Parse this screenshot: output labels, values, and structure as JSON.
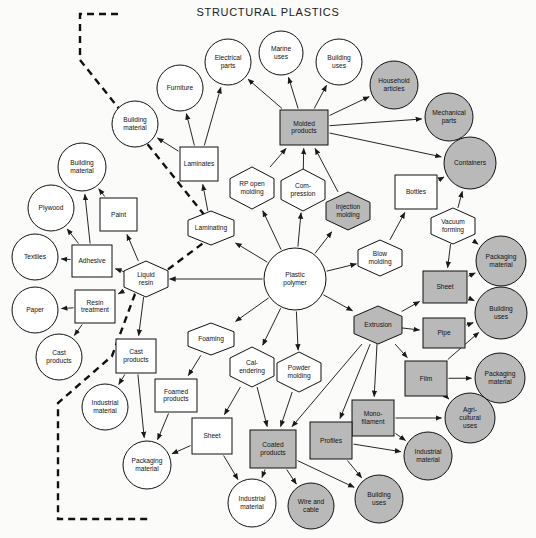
{
  "diagram": {
    "title": "STRUCTURAL PLASTICS",
    "legend": {
      "shaded_meaning": "shaded",
      "plain_meaning": "plain"
    },
    "colors": {
      "shaded": "#b9b9b9",
      "plain": "#ffffff",
      "stroke": "#111111",
      "background": "#fbfbf9"
    },
    "nodes": [
      {
        "id": "n1",
        "label": "Building material",
        "shape": "circle",
        "fill": "plain",
        "cx": 135,
        "cy": 124,
        "r": 23
      },
      {
        "id": "n2",
        "label": "Furniture",
        "shape": "circle",
        "fill": "plain",
        "cx": 180,
        "cy": 88,
        "r": 23
      },
      {
        "id": "n3",
        "label": "Electrical parts",
        "shape": "circle",
        "fill": "plain",
        "cx": 228,
        "cy": 62,
        "r": 23
      },
      {
        "id": "n4",
        "label": "Marine uses",
        "shape": "circle",
        "fill": "plain",
        "cx": 281,
        "cy": 53,
        "r": 22
      },
      {
        "id": "n5",
        "label": "Building uses",
        "shape": "circle",
        "fill": "plain",
        "cx": 339,
        "cy": 62,
        "r": 23
      },
      {
        "id": "n6",
        "label": "Household articles",
        "shape": "circle",
        "fill": "shaded",
        "cx": 394,
        "cy": 85,
        "r": 24
      },
      {
        "id": "n7",
        "label": "Mechanical parts",
        "shape": "circle",
        "fill": "shaded",
        "cx": 449,
        "cy": 117,
        "r": 24
      },
      {
        "id": "n8",
        "label": "Containers",
        "shape": "circle",
        "fill": "shaded",
        "cx": 470,
        "cy": 163,
        "r": 26
      },
      {
        "id": "n9",
        "label": "Building material",
        "shape": "circle",
        "fill": "plain",
        "cx": 82,
        "cy": 167,
        "r": 24
      },
      {
        "id": "n10",
        "label": "Plywood",
        "shape": "circle",
        "fill": "plain",
        "cx": 51,
        "cy": 208,
        "r": 23
      },
      {
        "id": "n11",
        "label": "Textiles",
        "shape": "circle",
        "fill": "plain",
        "cx": 35,
        "cy": 257,
        "r": 23
      },
      {
        "id": "n12",
        "label": "Paper",
        "shape": "circle",
        "fill": "plain",
        "cx": 35,
        "cy": 310,
        "r": 23
      },
      {
        "id": "n13",
        "label": "Cast products",
        "shape": "circle",
        "fill": "plain",
        "cx": 59,
        "cy": 357,
        "r": 23
      },
      {
        "id": "n14",
        "label": "Industrial material",
        "shape": "circle",
        "fill": "plain",
        "cx": 105,
        "cy": 407,
        "r": 23
      },
      {
        "id": "n15",
        "label": "Packaging material",
        "shape": "circle",
        "fill": "plain",
        "cx": 147,
        "cy": 465,
        "r": 24
      },
      {
        "id": "n16",
        "label": "Industrial material",
        "shape": "circle",
        "fill": "plain",
        "cx": 252,
        "cy": 503,
        "r": 24
      },
      {
        "id": "n17",
        "label": "Wire and cable",
        "shape": "circle",
        "fill": "shaded",
        "cx": 311,
        "cy": 506,
        "r": 23
      },
      {
        "id": "n18",
        "label": "Building uses",
        "shape": "circle",
        "fill": "shaded",
        "cx": 379,
        "cy": 499,
        "r": 24
      },
      {
        "id": "n19",
        "label": "Industrial material",
        "shape": "circle",
        "fill": "shaded",
        "cx": 428,
        "cy": 456,
        "r": 24
      },
      {
        "id": "n20",
        "label": "Agri- cultural uses",
        "shape": "circle",
        "fill": "shaded",
        "cx": 470,
        "cy": 418,
        "r": 25
      },
      {
        "id": "n21",
        "label": "Packaging material",
        "shape": "circle",
        "fill": "shaded",
        "cx": 500,
        "cy": 378,
        "r": 25
      },
      {
        "id": "n22",
        "label": "Building uses",
        "shape": "circle",
        "fill": "shaded",
        "cx": 501,
        "cy": 313,
        "r": 26
      },
      {
        "id": "n23",
        "label": "Packaging material",
        "shape": "circle",
        "fill": "shaded",
        "cx": 501,
        "cy": 261,
        "r": 25
      },
      {
        "id": "n24",
        "label": "Plastic polymer",
        "shape": "circle",
        "fill": "plain",
        "cx": 295,
        "cy": 279,
        "r": 31
      },
      {
        "id": "n25",
        "label": "Laminates",
        "shape": "rect",
        "fill": "plain",
        "x": 180,
        "y": 147,
        "w": 38,
        "h": 34
      },
      {
        "id": "n26",
        "label": "Molded products",
        "shape": "rect",
        "fill": "shaded",
        "x": 280,
        "y": 110,
        "w": 48,
        "h": 35
      },
      {
        "id": "n27",
        "label": "Paint",
        "shape": "rect",
        "fill": "plain",
        "x": 100,
        "y": 198,
        "w": 37,
        "h": 33
      },
      {
        "id": "n28",
        "label": "Adhesive",
        "shape": "rect",
        "fill": "plain",
        "x": 72,
        "y": 245,
        "w": 40,
        "h": 32
      },
      {
        "id": "n29",
        "label": "Resin treatment",
        "shape": "rect",
        "fill": "plain",
        "x": 75,
        "y": 290,
        "w": 40,
        "h": 33
      },
      {
        "id": "n30",
        "label": "Bottles",
        "shape": "rect",
        "fill": "plain",
        "x": 395,
        "y": 175,
        "w": 42,
        "h": 34
      },
      {
        "id": "n31",
        "label": "Sheet",
        "shape": "rect",
        "fill": "shaded",
        "x": 423,
        "y": 271,
        "w": 44,
        "h": 32
      },
      {
        "id": "n32",
        "label": "Pipe",
        "shape": "rect",
        "fill": "shaded",
        "x": 423,
        "y": 318,
        "w": 42,
        "h": 30
      },
      {
        "id": "n33",
        "label": "Film",
        "shape": "rect",
        "fill": "shaded",
        "x": 405,
        "y": 361,
        "w": 42,
        "h": 35
      },
      {
        "id": "n34",
        "label": "Mono- filament",
        "shape": "rect",
        "fill": "shaded",
        "x": 352,
        "y": 400,
        "w": 42,
        "h": 36
      },
      {
        "id": "n35",
        "label": "Profiles",
        "shape": "rect",
        "fill": "shaded",
        "x": 310,
        "y": 422,
        "w": 42,
        "h": 37
      },
      {
        "id": "n36",
        "label": "Coated products",
        "shape": "rect",
        "fill": "shaded",
        "x": 250,
        "y": 430,
        "w": 46,
        "h": 38
      },
      {
        "id": "n37",
        "label": "Sheet",
        "shape": "rect",
        "fill": "plain",
        "x": 192,
        "y": 418,
        "w": 40,
        "h": 36
      },
      {
        "id": "n38",
        "label": "Foamed products",
        "shape": "rect",
        "fill": "plain",
        "x": 155,
        "y": 379,
        "w": 42,
        "h": 33
      },
      {
        "id": "n39",
        "label": "Cast products",
        "shape": "rect",
        "fill": "plain",
        "x": 116,
        "y": 339,
        "w": 40,
        "h": 34
      },
      {
        "id": "n40",
        "label": "Laminating",
        "shape": "hex",
        "fill": "plain",
        "cx": 211,
        "cy": 228,
        "w": 46,
        "h": 34
      },
      {
        "id": "n41",
        "label": "RP open molding",
        "shape": "hex",
        "fill": "plain",
        "cx": 252,
        "cy": 188,
        "w": 44,
        "h": 42
      },
      {
        "id": "n42",
        "label": "Com- pression",
        "shape": "hex",
        "fill": "plain",
        "cx": 303,
        "cy": 190,
        "w": 44,
        "h": 42
      },
      {
        "id": "n43",
        "label": "Injection molding",
        "shape": "hex",
        "fill": "shaded",
        "cx": 348,
        "cy": 211,
        "w": 44,
        "h": 38
      },
      {
        "id": "n44",
        "label": "Blow molding",
        "shape": "hex",
        "fill": "plain",
        "cx": 380,
        "cy": 258,
        "w": 44,
        "h": 36
      },
      {
        "id": "n45",
        "label": "Vacuum forming",
        "shape": "hex",
        "fill": "plain",
        "cx": 453,
        "cy": 226,
        "w": 44,
        "h": 36
      },
      {
        "id": "n46",
        "label": "Extrusion",
        "shape": "hex",
        "fill": "shaded",
        "cx": 378,
        "cy": 325,
        "w": 48,
        "h": 38
      },
      {
        "id": "n47",
        "label": "Liquid resin",
        "shape": "hex",
        "fill": "plain",
        "cx": 146,
        "cy": 279,
        "w": 44,
        "h": 36
      },
      {
        "id": "n48",
        "label": "Foaming",
        "shape": "hex",
        "fill": "plain",
        "cx": 211,
        "cy": 339,
        "w": 46,
        "h": 32
      },
      {
        "id": "n49",
        "label": "Cal- endering",
        "shape": "hex",
        "fill": "plain",
        "cx": 252,
        "cy": 367,
        "w": 44,
        "h": 40
      },
      {
        "id": "n50",
        "label": "Powder molding",
        "shape": "hex",
        "fill": "plain",
        "cx": 299,
        "cy": 372,
        "w": 44,
        "h": 40
      }
    ],
    "edges": [
      {
        "from": "n25",
        "to": "n1"
      },
      {
        "from": "n25",
        "to": "n2"
      },
      {
        "from": "n25",
        "to": "n3"
      },
      {
        "from": "n26",
        "to": "n3"
      },
      {
        "from": "n26",
        "to": "n4"
      },
      {
        "from": "n26",
        "to": "n5"
      },
      {
        "from": "n26",
        "to": "n6"
      },
      {
        "from": "n26",
        "to": "n7"
      },
      {
        "from": "n26",
        "to": "n8"
      },
      {
        "from": "n40",
        "to": "n25"
      },
      {
        "from": "n41",
        "to": "n26"
      },
      {
        "from": "n42",
        "to": "n26"
      },
      {
        "from": "n43",
        "to": "n26"
      },
      {
        "from": "n24",
        "to": "n40"
      },
      {
        "from": "n24",
        "to": "n41"
      },
      {
        "from": "n24",
        "to": "n42"
      },
      {
        "from": "n24",
        "to": "n43"
      },
      {
        "from": "n24",
        "to": "n44"
      },
      {
        "from": "n24",
        "to": "n46"
      },
      {
        "from": "n24",
        "to": "n47"
      },
      {
        "from": "n24",
        "to": "n48"
      },
      {
        "from": "n24",
        "to": "n49"
      },
      {
        "from": "n24",
        "to": "n50"
      },
      {
        "from": "n44",
        "to": "n30"
      },
      {
        "from": "n30",
        "to": "n8"
      },
      {
        "from": "n45",
        "to": "n8"
      },
      {
        "from": "n45",
        "to": "n31"
      },
      {
        "from": "n45",
        "to": "n23"
      },
      {
        "from": "n31",
        "to": "n23"
      },
      {
        "from": "n31",
        "to": "n22"
      },
      {
        "from": "n46",
        "to": "n31"
      },
      {
        "from": "n46",
        "to": "n32"
      },
      {
        "from": "n46",
        "to": "n33"
      },
      {
        "from": "n46",
        "to": "n34"
      },
      {
        "from": "n46",
        "to": "n35"
      },
      {
        "from": "n46",
        "to": "n36"
      },
      {
        "from": "n32",
        "to": "n22"
      },
      {
        "from": "n33",
        "to": "n21"
      },
      {
        "from": "n33",
        "to": "n22"
      },
      {
        "from": "n33",
        "to": "n20"
      },
      {
        "from": "n34",
        "to": "n20"
      },
      {
        "from": "n34",
        "to": "n19"
      },
      {
        "from": "n35",
        "to": "n19"
      },
      {
        "from": "n35",
        "to": "n18"
      },
      {
        "from": "n36",
        "to": "n16"
      },
      {
        "from": "n36",
        "to": "n17"
      },
      {
        "from": "n36",
        "to": "n18"
      },
      {
        "from": "n49",
        "to": "n37"
      },
      {
        "from": "n49",
        "to": "n36"
      },
      {
        "from": "n50",
        "to": "n36"
      },
      {
        "from": "n37",
        "to": "n16"
      },
      {
        "from": "n37",
        "to": "n15"
      },
      {
        "from": "n48",
        "to": "n38"
      },
      {
        "from": "n38",
        "to": "n15"
      },
      {
        "from": "n39",
        "to": "n15"
      },
      {
        "from": "n39",
        "to": "n14"
      },
      {
        "from": "n47",
        "to": "n27"
      },
      {
        "from": "n47",
        "to": "n28"
      },
      {
        "from": "n47",
        "to": "n29"
      },
      {
        "from": "n47",
        "to": "n39"
      },
      {
        "from": "n27",
        "to": "n9"
      },
      {
        "from": "n28",
        "to": "n9"
      },
      {
        "from": "n28",
        "to": "n10"
      },
      {
        "from": "n28",
        "to": "n11"
      },
      {
        "from": "n29",
        "to": "n12"
      },
      {
        "from": "n29",
        "to": "n13"
      }
    ],
    "boundary_path": "M118,14 L80,14 L80,60 L218,232 L135,294 L112,356 L58,403 L58,519 L150,519"
  }
}
